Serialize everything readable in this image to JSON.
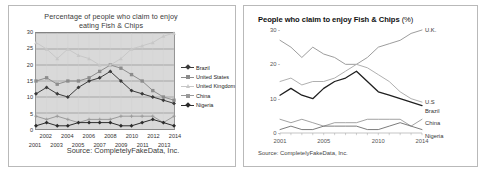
{
  "left_panel": {
    "title_line1": "Percentage of people who claim to enjoy",
    "title_line2": "eating Fish & Chips",
    "source": "Source: CompletelyFakeData, Inc.",
    "legend": [
      {
        "label": "Brazil",
        "color": "#3a3a3a",
        "marker": "diamond"
      },
      {
        "label": "United States",
        "color": "#8c8c8c",
        "marker": "square"
      },
      {
        "label": "United Kingdom",
        "color": "#c7c7c7",
        "marker": "triangle"
      },
      {
        "label": "China",
        "color": "#9a9a9a",
        "marker": "cross"
      },
      {
        "label": "Nigeria",
        "color": "#2b2b2b",
        "marker": "diamond"
      }
    ]
  },
  "right_panel": {
    "title": "People who claim to enjoy Fish & Chips",
    "title_unit": "(%)",
    "source": "Source: CompletelyFakeData, Inc.",
    "series_labels": [
      {
        "name": "U.K.",
        "value": 30
      },
      {
        "name": "U.S",
        "value": 9
      },
      {
        "name": "Brazil",
        "value": 8
      },
      {
        "name": "China",
        "value": 4
      },
      {
        "name": "Nigeria",
        "value": 1
      }
    ],
    "xticks_labelled": [
      "2001",
      "2005",
      "2010",
      "2014"
    ]
  },
  "chart_data": {
    "type": "line",
    "title": "Percentage of people who claim to enjoy eating Fish & Chips",
    "subtitle": "People who claim to enjoy Fish & Chips (%)",
    "xlabel": "",
    "ylabel": "",
    "ylim": [
      0,
      30
    ],
    "yticks": [
      0,
      5,
      10,
      15,
      20,
      25,
      30
    ],
    "grid": true,
    "legend_position": "right",
    "x": [
      2001,
      2002,
      2003,
      2004,
      2005,
      2006,
      2007,
      2008,
      2009,
      2010,
      2011,
      2012,
      2013,
      2014
    ],
    "categories": [
      "2001",
      "2002",
      "2003",
      "2004",
      "2005",
      "2006",
      "2007",
      "2008",
      "2009",
      "2010",
      "2011",
      "2012",
      "2013",
      "2014"
    ],
    "series": [
      {
        "name": "Brazil",
        "color": "#3a3a3a",
        "values": [
          11,
          13,
          11,
          10,
          13,
          15,
          16,
          18,
          15,
          12,
          11,
          10,
          9,
          8
        ]
      },
      {
        "name": "United States",
        "color": "#8c8c8c",
        "values": [
          15,
          16,
          14,
          15,
          15,
          16,
          18,
          20,
          19,
          17,
          15,
          12,
          10,
          9
        ]
      },
      {
        "name": "United Kingdom",
        "color": "#c7c7c7",
        "values": [
          27,
          25,
          22,
          25,
          23,
          22,
          20,
          20,
          22,
          25,
          26,
          27,
          29,
          30
        ]
      },
      {
        "name": "China",
        "color": "#9a9a9a",
        "values": [
          4,
          3,
          4,
          3,
          2,
          3,
          3,
          3,
          4,
          4,
          4,
          4,
          2,
          4
        ]
      },
      {
        "name": "Nigeria",
        "color": "#2b2b2b",
        "values": [
          1,
          2,
          1,
          1,
          2,
          2,
          2,
          2,
          1,
          1,
          2,
          3,
          2,
          1
        ]
      }
    ]
  }
}
